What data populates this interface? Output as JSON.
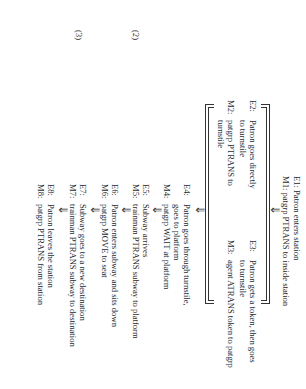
{
  "diagram": {
    "step1": {
      "e_label": "E1:",
      "e_text": "Patron enters station",
      "m_label": "M1:",
      "m_text": "patgrp PTRANS to inside station"
    },
    "branch_left": {
      "e_label": "E2:",
      "e_text": "Patron goes directly",
      "e_text2": "to turnstile",
      "m_label": "M2:",
      "m_text": "patgrp PTRANS to",
      "m_text2": "turnstile"
    },
    "branch_right": {
      "e_label": "E3:",
      "e_text": "Patron gets a token, then goes",
      "e_text2": "to turnstile",
      "m_label": "M3:",
      "m_text": "agent ATRANS token to patgrp"
    },
    "steps": [
      {
        "e_label": "E4:",
        "e_text": "Patron goes through turnstile,",
        "e_text2": "goes to platform",
        "m_label": "M4:",
        "m_text": "patgrp WAIT at platform"
      },
      {
        "e_label": "E5:",
        "e_text": "Subway arrives",
        "m_label": "M5:",
        "m_text": "trainman PTRANS subway to platform"
      },
      {
        "e_label": "E6:",
        "e_text": "Patron enters subway and sits down",
        "m_label": "M6:",
        "m_text": "patgrp MOVE to seat"
      },
      {
        "e_label": "E7:",
        "e_text": "Subway goes to a new destination",
        "m_label": "M7:",
        "m_text": "trainman PTRANS subway to destination"
      },
      {
        "e_label": "E8:",
        "e_text": "Patron leaves the station",
        "m_label": "M8:",
        "m_text": "patgrp PTRANS from station"
      }
    ],
    "equation_numbers": [
      "(2)",
      "(3)"
    ],
    "arrow_glyph": "⇓"
  }
}
